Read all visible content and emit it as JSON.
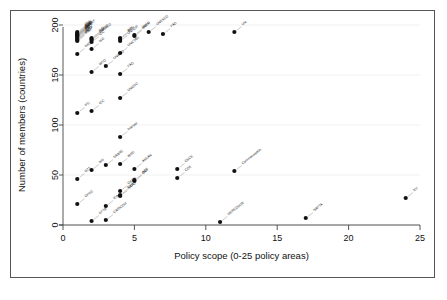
{
  "figure": {
    "background_color": "#ffffff",
    "frame_color": "#555555",
    "marker_color": "#111111",
    "grid_color": "#e8e8e8"
  },
  "chart_data": {
    "type": "scatter",
    "title": "",
    "subtitle": "",
    "xlabel": "Policy scope (0-25 policy areas)",
    "ylabel": "Number of members (countries)",
    "xlim": [
      0,
      25
    ],
    "ylim": [
      0,
      200
    ],
    "xticks": [
      0,
      5,
      10,
      15,
      20,
      25
    ],
    "yticks": [
      0,
      50,
      100,
      150,
      200
    ],
    "xtick_labels": [
      "0",
      "5",
      "10",
      "15",
      "20",
      "25"
    ],
    "ytick_labels": [
      "0",
      "50",
      "100",
      "150",
      "200"
    ],
    "grid": true,
    "legend": "none",
    "marker_shape": "filled-circle",
    "points": [
      {
        "label": "ITU",
        "x": 1,
        "y": 193
      },
      {
        "label": "UPU",
        "x": 1,
        "y": 192
      },
      {
        "label": "WMO",
        "x": 1,
        "y": 191
      },
      {
        "label": "IAEA",
        "x": 1,
        "y": 190
      },
      {
        "label": "ICAO",
        "x": 1,
        "y": 191
      },
      {
        "label": "WIPO",
        "x": 1,
        "y": 189
      },
      {
        "label": "UNICEF",
        "x": 1,
        "y": 190
      },
      {
        "label": "IMF",
        "x": 1,
        "y": 189
      },
      {
        "label": "IBRD",
        "x": 1,
        "y": 188
      },
      {
        "label": "IDA",
        "x": 1,
        "y": 187
      },
      {
        "label": "WHO",
        "x": 1,
        "y": 186
      },
      {
        "label": "UNDP",
        "x": 1,
        "y": 185
      },
      {
        "label": "IFAD",
        "x": 1,
        "y": 184
      },
      {
        "label": "IMO",
        "x": 1,
        "y": 171
      },
      {
        "label": "IFC",
        "x": 1,
        "y": 112
      },
      {
        "label": "G77",
        "x": 1,
        "y": 46
      },
      {
        "label": "OPEC",
        "x": 1,
        "y": 21
      },
      {
        "label": "ILO",
        "x": 2,
        "y": 187
      },
      {
        "label": "UNIDO",
        "x": 2,
        "y": 186
      },
      {
        "label": "UNESCO",
        "x": 2,
        "y": 185
      },
      {
        "label": "ICC",
        "x": 2,
        "y": 183
      },
      {
        "label": "ISO",
        "x": 2,
        "y": 176
      },
      {
        "label": "WTO",
        "x": 2,
        "y": 153
      },
      {
        "label": "ICC",
        "x": 2,
        "y": 114
      },
      {
        "label": "BIS",
        "x": 2,
        "y": 55
      },
      {
        "label": "EFTA",
        "x": 2,
        "y": 4
      },
      {
        "label": "UNWTO",
        "x": 3,
        "y": 159
      },
      {
        "label": "SAARC",
        "x": 3,
        "y": 60
      },
      {
        "label": "IDA",
        "x": 3,
        "y": 19
      },
      {
        "label": "CARICOM",
        "x": 3,
        "y": 5
      },
      {
        "label": "IMF",
        "x": 4,
        "y": 187
      },
      {
        "label": "WFP",
        "x": 4,
        "y": 186
      },
      {
        "label": "UNHCR",
        "x": 4,
        "y": 184
      },
      {
        "label": "UNCTAD",
        "x": 4,
        "y": 172
      },
      {
        "label": "FAO",
        "x": 4,
        "y": 151
      },
      {
        "label": "UNODC",
        "x": 4,
        "y": 127
      },
      {
        "label": "Interpol",
        "x": 4,
        "y": 88
      },
      {
        "label": "IBRD",
        "x": 4,
        "y": 61
      },
      {
        "label": "OECD",
        "x": 4,
        "y": 34
      },
      {
        "label": "NATO",
        "x": 4,
        "y": 29
      },
      {
        "label": "EEA",
        "x": 4,
        "y": 30
      },
      {
        "label": "WIPO",
        "x": 5,
        "y": 190
      },
      {
        "label": "UNDP",
        "x": 5,
        "y": 189
      },
      {
        "label": "ASEAN",
        "x": 5,
        "y": 56
      },
      {
        "label": "ACP",
        "x": 5,
        "y": 45
      },
      {
        "label": "OAS",
        "x": 5,
        "y": 44
      },
      {
        "label": "UNESCO",
        "x": 6,
        "y": 193
      },
      {
        "label": "FAO",
        "x": 7,
        "y": 191
      },
      {
        "label": "OSCE",
        "x": 8,
        "y": 56
      },
      {
        "label": "COE",
        "x": 8,
        "y": 47
      },
      {
        "label": "MERCOSUR",
        "x": 11,
        "y": 3
      },
      {
        "label": "Commonwealth",
        "x": 12,
        "y": 54
      },
      {
        "label": "UN",
        "x": 12,
        "y": 193
      },
      {
        "label": "NAFTA",
        "x": 17,
        "y": 7
      },
      {
        "label": "EU",
        "x": 24,
        "y": 27
      }
    ]
  }
}
